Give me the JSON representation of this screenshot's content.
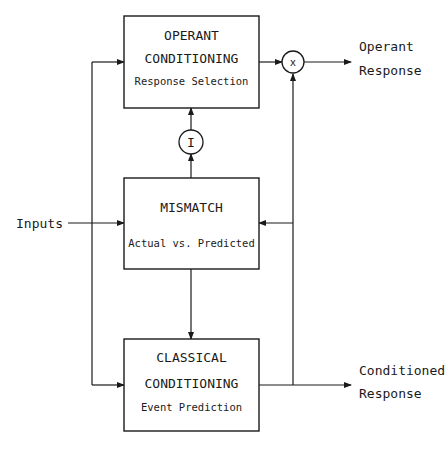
{
  "diagram": {
    "colors": {
      "line": "#1a1a1a",
      "background": "#ffffff"
    },
    "blocks": {
      "operant": {
        "title_line1": "OPERANT",
        "title_line2": "CONDITIONING",
        "subtitle": "Response Selection"
      },
      "mismatch": {
        "title": "MISMATCH",
        "subtitle": "Actual vs. Predicted"
      },
      "classical": {
        "title_line1": "CLASSICAL",
        "title_line2": "CONDITIONING",
        "subtitle": "Event Prediction"
      }
    },
    "nodes": {
      "multiplier": {
        "symbol": "x"
      },
      "inhibitor": {
        "symbol": "I"
      }
    },
    "labels": {
      "inputs": "Inputs",
      "operant_output_line1": "Operant",
      "operant_output_line2": "Response",
      "conditioned_output_line1": "Conditioned",
      "conditioned_output_line2": "Response"
    }
  }
}
